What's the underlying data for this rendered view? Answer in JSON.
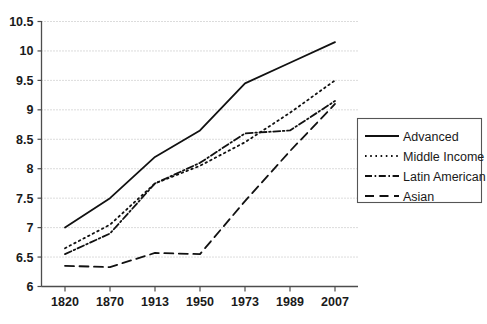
{
  "chart_data": {
    "type": "line",
    "title": "",
    "xlabel": "",
    "ylabel": "",
    "categories": [
      "1820",
      "1870",
      "1913",
      "1950",
      "1973",
      "1989",
      "2007"
    ],
    "x": [
      1820,
      1870,
      1913,
      1950,
      1973,
      1989,
      2007
    ],
    "ylim": [
      6,
      10.5
    ],
    "yticks": [
      "6",
      "6.5",
      "7",
      "7.5",
      "8",
      "8.5",
      "9",
      "9.5",
      "10",
      "10.5"
    ],
    "ytick_values": [
      6,
      6.5,
      7,
      7.5,
      8,
      8.5,
      9,
      9.5,
      10,
      10.5
    ],
    "grid": true,
    "legend_position": "right",
    "series": [
      {
        "name": "Advanced",
        "style": "solid",
        "values": [
          7.0,
          7.5,
          8.2,
          8.65,
          9.45,
          9.8,
          10.15
        ]
      },
      {
        "name": "Middle Income",
        "style": "dotted",
        "values": [
          6.65,
          7.05,
          7.75,
          8.05,
          8.45,
          8.95,
          9.5
        ]
      },
      {
        "name": "Latin American",
        "style": "dashdot",
        "values": [
          6.55,
          6.9,
          7.75,
          8.1,
          8.6,
          8.65,
          9.15
        ]
      },
      {
        "name": "Asian",
        "style": "dashed",
        "values": [
          6.35,
          6.33,
          6.57,
          6.55,
          7.45,
          8.3,
          9.1
        ]
      }
    ]
  },
  "legend": {
    "items": [
      {
        "label": "Advanced",
        "swatch": "solid-line-swatch"
      },
      {
        "label": "Middle Income",
        "swatch": "dotted-line-swatch"
      },
      {
        "label": "Latin American",
        "swatch": "dashdot-line-swatch"
      },
      {
        "label": "Asian",
        "swatch": "dashed-line-swatch"
      }
    ]
  },
  "axes": {
    "y_tick_labels": [
      "10.5",
      "10",
      "9.5",
      "9",
      "8.5",
      "8",
      "7.5",
      "7",
      "6.5",
      "6"
    ],
    "x_tick_labels": [
      "1820",
      "1870",
      "1913",
      "1950",
      "1973",
      "1989",
      "2007"
    ]
  }
}
